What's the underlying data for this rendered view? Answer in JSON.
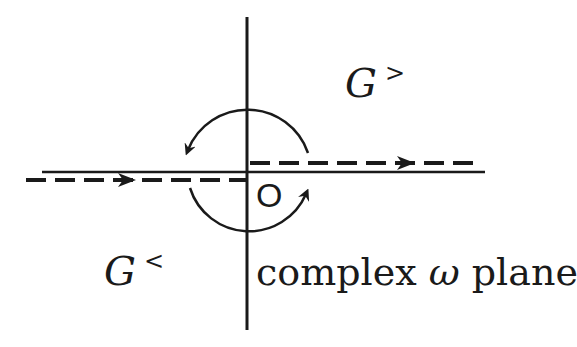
{
  "diagram": {
    "colors": {
      "ink": "#1a1a1a",
      "background": "#ffffff"
    },
    "labels": {
      "g_greater": {
        "symbol": "G",
        "superscript": ">"
      },
      "g_lesser": {
        "symbol": "G",
        "superscript": "<"
      },
      "origin": "O",
      "plane": {
        "prefix": "complex",
        "variable": "ω",
        "suffix": "plane"
      }
    },
    "elements": {
      "vertical_axis": "imaginary axis",
      "upper_branch": "dashed contour above real axis, arrow pointing right (to +∞)",
      "lower_branch": "dashed contour below real axis, arrow pointing right (from −∞)",
      "upper_arc": "counter-clockwise arc through upper half plane",
      "lower_arc": "counter-clockwise arc through lower half plane"
    }
  }
}
